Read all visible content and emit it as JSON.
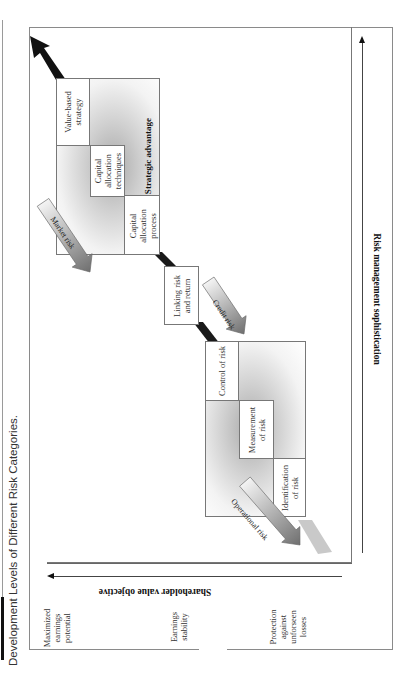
{
  "figure": {
    "title": "Development Levels of Different Risk Categories.",
    "orientation": "rotated 90° counter-clockwise"
  },
  "axes": {
    "x_axis_label": "Risk management sophistication",
    "y_axis_label": "Shareholder value objective",
    "y_levels": [
      {
        "id": "top",
        "label": "Maximized earnings potential",
        "lines": [
          "Maximized",
          "earnings",
          "potential"
        ]
      },
      {
        "id": "middle",
        "label": "Earnings stability",
        "lines": [
          "Earnings",
          "stability"
        ]
      },
      {
        "id": "bottom",
        "label": "Protection against unforseen losses",
        "lines": [
          "Protection",
          "against",
          "unforseen",
          "losses"
        ]
      }
    ]
  },
  "stages": {
    "lower_block": {
      "cells": [
        {
          "id": "identification",
          "label": "Identification of risk",
          "lines": [
            "Identification",
            "of risk"
          ]
        },
        {
          "id": "measurement",
          "label": "Measurement of risk",
          "lines": [
            "Measurement",
            "of risk"
          ]
        },
        {
          "id": "control",
          "label": "Control of risk",
          "lines": [
            "Control of risk"
          ]
        }
      ]
    },
    "linking": {
      "label": "Linking risk and return",
      "lines": [
        "Linking risk",
        "and return"
      ]
    },
    "upper_block": {
      "cells": [
        {
          "id": "process",
          "label": "Capital allocation process",
          "lines": [
            "Capital",
            "allocation",
            "process"
          ]
        },
        {
          "id": "techniques",
          "label": "Capital allocation techniques",
          "lines": [
            "Capital",
            "allocation",
            "techniques"
          ]
        },
        {
          "id": "value_strategy",
          "label": "Value-based strategy",
          "lines": [
            "Value-based",
            "strategy"
          ]
        }
      ],
      "caption": "Strategic advantage"
    }
  },
  "risk_arrows": [
    {
      "id": "operational",
      "label": "Operational risk"
    },
    {
      "id": "credit",
      "label": "Credit risk"
    },
    {
      "id": "market",
      "label": "Market risk"
    }
  ],
  "colors": {
    "band": "#1a1a1a",
    "risk_arrow_fill_start": "#f4f4f4",
    "risk_arrow_fill_end": "#6f6f6f",
    "frame": "#8a8a8a"
  }
}
